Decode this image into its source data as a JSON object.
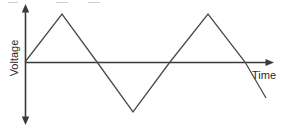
{
  "figure": {
    "kind": "line-graph",
    "background_color": "#ffffff",
    "stroke_color": "#4a4a4a",
    "axis_color": "#3a3a3a",
    "label_color": "#2b2b2b"
  },
  "axes": {
    "y_label": "Voltage",
    "x_label": "Time",
    "origin": {
      "x": 25,
      "y": 62
    },
    "y_axis": {
      "top": 6,
      "bottom": 122,
      "arrows": "both"
    },
    "x_axis": {
      "left": 25,
      "right": 272,
      "arrows": "right"
    }
  },
  "chart_data": {
    "type": "line",
    "title": "",
    "xlabel": "Time",
    "ylabel": "Voltage",
    "grid": false,
    "legend": "none",
    "waveform": "triangle",
    "cycles": 1.5,
    "amplitude": 1,
    "xlim": [
      0,
      1.6
    ],
    "ylim": [
      -1.1,
      1.1
    ],
    "series": [
      {
        "name": "Voltage",
        "x": [
          0.0,
          0.15,
          0.29,
          0.44,
          0.74,
          0.98,
          1.0
        ],
        "y": [
          0.0,
          1.0,
          0.0,
          -1.0,
          1.0,
          -0.3,
          -0.75
        ]
      }
    ],
    "points_px": [
      {
        "x": 25,
        "y": 62,
        "role": "origin-start"
      },
      {
        "x": 62,
        "y": 14,
        "role": "peak-1"
      },
      {
        "x": 97,
        "y": 62,
        "role": "zero-crossing-1"
      },
      {
        "x": 133,
        "y": 112,
        "role": "trough-1"
      },
      {
        "x": 170,
        "y": 62,
        "role": "zero-crossing-2"
      },
      {
        "x": 208,
        "y": 14,
        "role": "peak-2"
      },
      {
        "x": 245,
        "y": 62,
        "role": "zero-crossing-3"
      },
      {
        "x": 266,
        "y": 98,
        "role": "end"
      }
    ]
  },
  "artifacts": {
    "top_dashes": [
      {
        "x": 8,
        "y": 2,
        "width": 10
      },
      {
        "x": 56,
        "y": 2,
        "width": 12
      },
      {
        "x": 88,
        "y": 2,
        "width": 12
      }
    ]
  }
}
